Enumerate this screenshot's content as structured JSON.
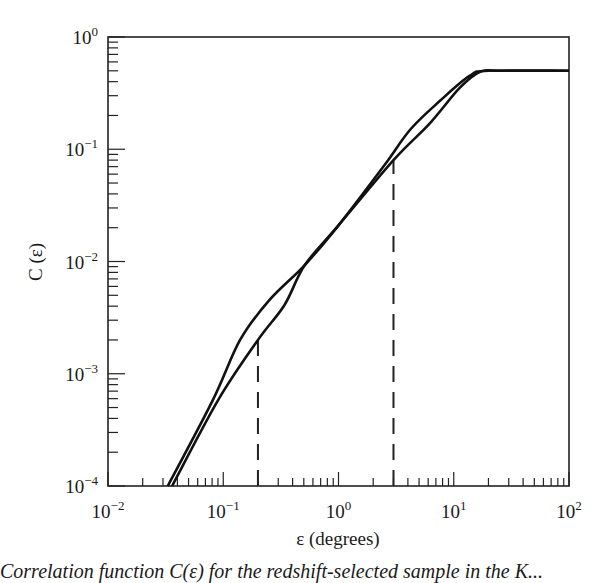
{
  "chart_data": {
    "type": "line",
    "title": "",
    "xlabel": "ε (degrees)",
    "ylabel": "C (ε)",
    "xscale": "log",
    "yscale": "log",
    "xlim": [
      0.01,
      100
    ],
    "ylim": [
      0.0001,
      1
    ],
    "grid": false,
    "legend": null,
    "x_tick_labels": [
      {
        "base": "10",
        "exp": "−2",
        "value": 0.01
      },
      {
        "base": "10",
        "exp": "−1",
        "value": 0.1
      },
      {
        "base": "10",
        "exp": "0",
        "value": 1
      },
      {
        "base": "10",
        "exp": "1",
        "value": 10
      },
      {
        "base": "10",
        "exp": "2",
        "value": 100
      }
    ],
    "y_tick_labels": [
      {
        "base": "10",
        "exp": "−4",
        "value": 0.0001
      },
      {
        "base": "10",
        "exp": "−3",
        "value": 0.001
      },
      {
        "base": "10",
        "exp": "−2",
        "value": 0.01
      },
      {
        "base": "10",
        "exp": "−1",
        "value": 0.1
      },
      {
        "base": "10",
        "exp": "0",
        "value": 1
      }
    ],
    "series": [
      {
        "name": "curve-1",
        "style": "solid",
        "x": [
          0.033,
          0.081,
          0.14,
          0.25,
          0.51,
          1.0,
          2.5,
          4.2,
          7.6,
          13.7,
          20,
          100
        ],
        "y": [
          0.0001,
          0.00058,
          0.002,
          0.0045,
          0.0093,
          0.021,
          0.072,
          0.15,
          0.27,
          0.45,
          0.5,
          0.5
        ]
      },
      {
        "name": "curve-2",
        "style": "solid",
        "x": [
          0.036,
          0.09,
          0.2,
          0.34,
          0.51,
          1.0,
          3.0,
          6.2,
          11.2,
          16.9,
          25,
          100
        ],
        "y": [
          0.0001,
          0.00058,
          0.002,
          0.0041,
          0.0093,
          0.021,
          0.08,
          0.17,
          0.35,
          0.49,
          0.5,
          0.5
        ]
      }
    ],
    "annotations": [
      {
        "type": "vertical-dashed-line",
        "x": 0.2,
        "y_top": 0.002
      },
      {
        "type": "vertical-dashed-line",
        "x": 3.0,
        "y_top": 0.08
      }
    ]
  },
  "caption": "Correlation function C(ε) for the redshift-selected sample in the K..."
}
